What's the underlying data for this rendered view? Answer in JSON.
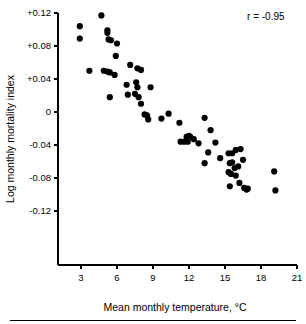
{
  "chart_data": {
    "type": "scatter",
    "title": "",
    "xlabel": "Mean monthly temperature, °C",
    "ylabel": "Log monthly mortality index",
    "xlim": [
      1.5,
      21
    ],
    "ylim": [
      -0.135,
      0.125
    ],
    "xticks": [
      3,
      6,
      9,
      12,
      15,
      18,
      21
    ],
    "xtick_labels": [
      "3",
      "6",
      "9",
      "12",
      "15",
      "18",
      "21"
    ],
    "yticks": [
      0.12,
      0.08,
      0.04,
      0,
      -0.04,
      -0.08,
      -0.12
    ],
    "ytick_labels": [
      "+0.12",
      "+0.08",
      "+0.04",
      "0",
      "-0.04",
      "-0.08",
      "-0.12"
    ],
    "grid": false,
    "legend": null,
    "annotations": [
      {
        "text": "r = -0.95",
        "x": 18.4,
        "y": 0.112
      }
    ],
    "marker": {
      "shape": "circle",
      "color": "#000000",
      "size": 3.1
    },
    "series": [
      {
        "name": "monthly observations",
        "points": [
          [
            2.9,
            0.104
          ],
          [
            2.9,
            0.089
          ],
          [
            4.7,
            0.117
          ],
          [
            3.7,
            0.05
          ],
          [
            5.2,
            0.099
          ],
          [
            5.2,
            0.096
          ],
          [
            5.3,
            0.088
          ],
          [
            5.5,
            0.087
          ],
          [
            6.0,
            0.083
          ],
          [
            5.9,
            0.068
          ],
          [
            4.9,
            0.05
          ],
          [
            5.2,
            0.049
          ],
          [
            5.4,
            0.048
          ],
          [
            5.8,
            0.045
          ],
          [
            5.4,
            0.018
          ],
          [
            7.1,
            0.057
          ],
          [
            7.7,
            0.053
          ],
          [
            8.0,
            0.051
          ],
          [
            6.8,
            0.033
          ],
          [
            6.9,
            0.021
          ],
          [
            7.6,
            0.036
          ],
          [
            7.7,
            0.03
          ],
          [
            7.5,
            0.022
          ],
          [
            7.8,
            0.018
          ],
          [
            8.0,
            0.01
          ],
          [
            8.8,
            0.03
          ],
          [
            8.6,
            -0.009
          ],
          [
            8.3,
            -0.003
          ],
          [
            8.5,
            -0.004
          ],
          [
            9.7,
            -0.008
          ],
          [
            10.3,
            -0.002
          ],
          [
            11.2,
            -0.013
          ],
          [
            11.3,
            -0.036
          ],
          [
            11.6,
            -0.036
          ],
          [
            11.9,
            -0.036
          ],
          [
            11.8,
            -0.03
          ],
          [
            12.0,
            -0.029
          ],
          [
            12.1,
            -0.03
          ],
          [
            12.4,
            -0.033
          ],
          [
            12.8,
            -0.038
          ],
          [
            13.3,
            -0.007
          ],
          [
            13.8,
            -0.022
          ],
          [
            13.6,
            -0.049
          ],
          [
            14.2,
            -0.037
          ],
          [
            14.6,
            -0.056
          ],
          [
            13.3,
            -0.062
          ],
          [
            15.3,
            -0.05
          ],
          [
            15.6,
            -0.05
          ],
          [
            15.9,
            -0.046
          ],
          [
            16.3,
            -0.045
          ],
          [
            15.4,
            -0.062
          ],
          [
            15.6,
            -0.061
          ],
          [
            15.3,
            -0.073
          ],
          [
            15.8,
            -0.068
          ],
          [
            16.1,
            -0.066
          ],
          [
            16.5,
            -0.058
          ],
          [
            15.5,
            -0.075
          ],
          [
            15.9,
            -0.077
          ],
          [
            15.4,
            -0.09
          ],
          [
            16.2,
            -0.086
          ],
          [
            16.6,
            -0.092
          ],
          [
            16.8,
            -0.094
          ],
          [
            16.9,
            -0.093
          ],
          [
            19.1,
            -0.072
          ],
          [
            19.2,
            -0.095
          ]
        ]
      }
    ]
  },
  "axes": {
    "x_axis_name": "x-axis",
    "y_axis_name": "y-axis"
  },
  "footer": {
    "rule": true
  }
}
